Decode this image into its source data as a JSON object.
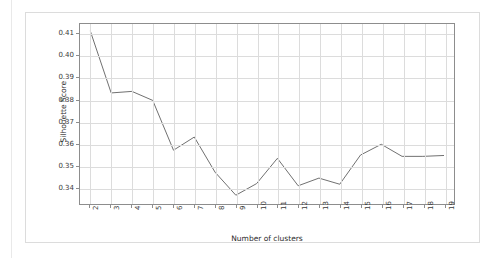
{
  "figure": {
    "kind": "line-chart-figure",
    "background_color": "#ffffff",
    "frame_color": "#dcdcdc"
  },
  "chart_data": {
    "type": "line",
    "title": "",
    "xlabel": "Number of clusters",
    "ylabel": "Silhouette Score",
    "x": [
      2,
      3,
      4,
      5,
      6,
      7,
      8,
      9,
      10,
      11,
      12,
      13,
      14,
      15,
      16,
      17,
      18,
      19
    ],
    "values": [
      0.4112,
      0.3831,
      0.3838,
      0.3797,
      0.357,
      0.363,
      0.347,
      0.3365,
      0.3418,
      0.3533,
      0.3408,
      0.3443,
      0.3415,
      0.3548,
      0.3597,
      0.3542,
      0.3542,
      0.3546
    ],
    "series": [
      {
        "name": "Silhouette Score",
        "color": "#6e6e6e",
        "values": [
          0.4112,
          0.3831,
          0.3838,
          0.3797,
          0.357,
          0.363,
          0.347,
          0.3365,
          0.3418,
          0.3533,
          0.3408,
          0.3443,
          0.3415,
          0.3548,
          0.3597,
          0.3542,
          0.3542,
          0.3546
        ]
      }
    ],
    "x_tick_labels": [
      "2",
      "3",
      "4",
      "5",
      "6",
      "7",
      "8",
      "9",
      "10",
      "11",
      "12",
      "13",
      "14",
      "15",
      "16",
      "17",
      "18",
      "19"
    ],
    "y_tick_labels": [
      "0.34",
      "0.35",
      "0.36",
      "0.37",
      "0.38",
      "0.39",
      "0.40",
      "0.41"
    ],
    "y_tick_values": [
      0.34,
      0.35,
      0.36,
      0.37,
      0.38,
      0.39,
      0.4,
      0.41
    ],
    "ylim": [
      0.3325,
      0.4145
    ],
    "xlim": [
      1.5,
      19.5
    ],
    "grid": true,
    "grid_color": "#dcdcdc",
    "axis_color": "#8d8d8d",
    "legend": null,
    "legend_position": "none",
    "line_width": 1
  }
}
